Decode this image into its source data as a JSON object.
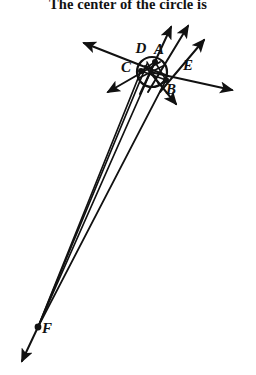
{
  "page": {
    "width": 256,
    "height": 375,
    "background": "#ffffff",
    "ink_color": "#111111"
  },
  "prompt": {
    "text": "The center of the circle is",
    "note": "partially cropped line of body text at very top of image"
  },
  "figure": {
    "type": "geometry-diagram",
    "circle": {
      "label": "circle",
      "center_x": 152,
      "center_y": 72,
      "radius": 15
    },
    "points": [
      {
        "id": "A",
        "label": "A",
        "x": 155,
        "y": 62,
        "label_x": 159,
        "label_y": 54,
        "dot": true
      },
      {
        "id": "B",
        "label": "B",
        "x": 166,
        "y": 80,
        "label_x": 171,
        "label_y": 94,
        "dot": true
      },
      {
        "id": "C",
        "label": "C",
        "x": 141,
        "y": 71,
        "label_x": 126,
        "label_y": 72,
        "dot": true
      },
      {
        "id": "D",
        "label": "D",
        "x": 147,
        "y": 62,
        "label_x": 141,
        "label_y": 53,
        "dot": false
      },
      {
        "id": "E",
        "label": "E",
        "x": 167,
        "y": 68,
        "label_x": 188,
        "label_y": 70,
        "dot": false
      },
      {
        "id": "F",
        "label": "F",
        "x": 38,
        "y": 327,
        "label_x": 47,
        "label_y": 333,
        "dot": true
      }
    ],
    "rays": [
      {
        "name": "ray-up-left",
        "x1": 168,
        "y1": 76,
        "x2": 84,
        "y2": 43,
        "arrow": "end"
      },
      {
        "name": "ray-up-right-1",
        "x1": 140,
        "y1": 94,
        "x2": 171,
        "y2": 27,
        "arrow": "end"
      },
      {
        "name": "ray-up-right-2",
        "x1": 148,
        "y1": 92,
        "x2": 188,
        "y2": 26,
        "arrow": "end"
      },
      {
        "name": "ray-up-right-3",
        "x1": 160,
        "y1": 92,
        "x2": 204,
        "y2": 40,
        "arrow": "end"
      },
      {
        "name": "ray-right",
        "x1": 150,
        "y1": 72,
        "x2": 232,
        "y2": 90,
        "arrow": "end"
      },
      {
        "name": "ray-down-left",
        "x1": 160,
        "y1": 62,
        "x2": 108,
        "y2": 92,
        "arrow": "end"
      },
      {
        "name": "ray-down-right",
        "x1": 145,
        "y1": 66,
        "x2": 176,
        "y2": 104,
        "arrow": "end"
      }
    ],
    "converging_lines": [
      {
        "name": "line-A-to-F",
        "x1": 155,
        "y1": 62,
        "x2": 38,
        "y2": 327
      },
      {
        "name": "line-D-to-F",
        "x1": 147,
        "y1": 64,
        "x2": 38,
        "y2": 327
      },
      {
        "name": "line-C-to-F",
        "x1": 141,
        "y1": 71,
        "x2": 38,
        "y2": 327
      },
      {
        "name": "line-B-to-F",
        "x1": 166,
        "y1": 80,
        "x2": 38,
        "y2": 327
      }
    ],
    "f_tail": {
      "name": "ray-f-tail",
      "x1": 38,
      "y1": 327,
      "x2": 22,
      "y2": 361,
      "arrow": "end"
    },
    "chords": [
      {
        "name": "chord-1",
        "x1": 141,
        "y1": 71,
        "x2": 166,
        "y2": 80
      },
      {
        "name": "chord-2",
        "x1": 155,
        "y1": 62,
        "x2": 166,
        "y2": 80
      },
      {
        "name": "chord-3",
        "x1": 141,
        "y1": 71,
        "x2": 155,
        "y2": 62
      },
      {
        "name": "chord-4",
        "x1": 147,
        "y1": 62,
        "x2": 159,
        "y2": 85
      },
      {
        "name": "chord-5",
        "x1": 139,
        "y1": 78,
        "x2": 165,
        "y2": 65
      }
    ]
  }
}
